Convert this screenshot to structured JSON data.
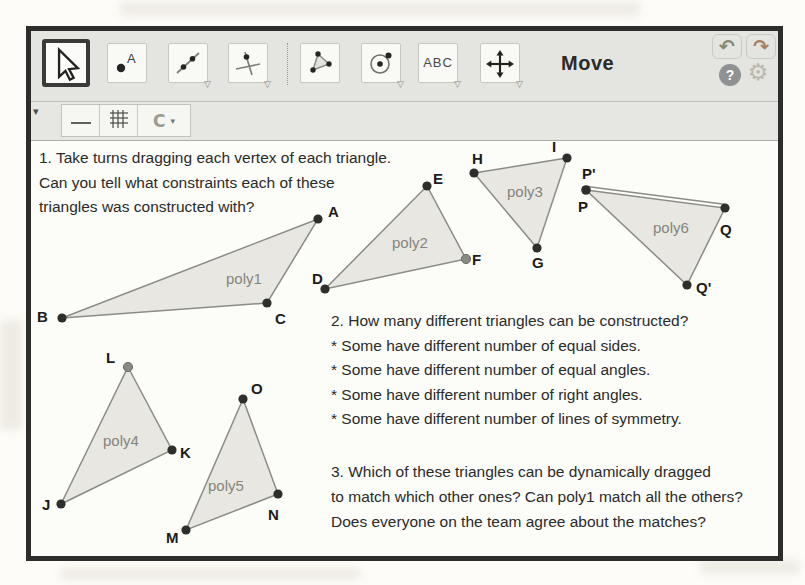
{
  "toolbar": {
    "mode_label": "Move",
    "text_tool_label": "ABC"
  },
  "icons": {
    "undo": "↶",
    "redo": "↷",
    "help": "?",
    "settings": "⚙",
    "tool_dropdown": "▽",
    "stylebar_collapse": "▾",
    "capture_letter": "C",
    "capture_menu_arrow": "▾"
  },
  "questions": {
    "q1": {
      "lines": [
        "1. Take turns dragging each vertex of each triangle.",
        "Can you tell what constraints each of these",
        "triangles was constructed with?"
      ]
    },
    "q2": {
      "lines": [
        "2. How many different triangles can be constructed?",
        "* Some have different number of equal sides.",
        "* Some have different number of equal angles.",
        "* Some have different number of right angles.",
        "* Some have different number of lines of symmetry."
      ]
    },
    "q3": {
      "lines": [
        "3. Which of these triangles can be dynamically dragged",
        "to match which other ones? Can poly1 match all the others?",
        "Does everyone on the team agree about the matches?"
      ]
    }
  },
  "polygons": [
    {
      "label": "poly1",
      "vertices": [
        {
          "label": "A"
        },
        {
          "label": "B"
        },
        {
          "label": "C"
        }
      ]
    },
    {
      "label": "poly2",
      "vertices": [
        {
          "label": "D"
        },
        {
          "label": "E"
        },
        {
          "label": "F"
        }
      ]
    },
    {
      "label": "poly3",
      "vertices": [
        {
          "label": "H"
        },
        {
          "label": "I"
        },
        {
          "label": "G"
        }
      ]
    },
    {
      "label": "poly6",
      "vertices": [
        {
          "label": "P'"
        },
        {
          "label": "P"
        },
        {
          "label": "Q"
        },
        {
          "label": "Q'"
        }
      ]
    },
    {
      "label": "poly4",
      "vertices": [
        {
          "label": "L"
        },
        {
          "label": "K"
        },
        {
          "label": "J"
        }
      ]
    },
    {
      "label": "poly5",
      "vertices": [
        {
          "label": "O"
        },
        {
          "label": "N"
        },
        {
          "label": "M"
        }
      ]
    }
  ],
  "colors": {
    "window_border": "#2d2d2b",
    "toolbar_bg": "#e4e4e1",
    "canvas_bg": "#fcfcf9",
    "triangle_fill": "#e8e7e2",
    "triangle_edge": "#8c8c87",
    "vertex_point": "#2e2e2c",
    "vertex_point_light": "#8a8a85",
    "vertex_label": "#1c1c1a",
    "poly_label": "#85857d",
    "question_text": "#2b2b29"
  }
}
